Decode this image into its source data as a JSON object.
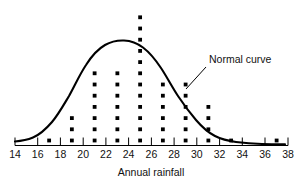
{
  "chart_data": {
    "type": "scatter",
    "title": "",
    "subtitle": "",
    "xlabel": "Annual rainfall",
    "ylabel": "",
    "xlim": [
      14,
      38
    ],
    "ylim": [
      0,
      13
    ],
    "grid": false,
    "legend_position": "none",
    "xticks": [
      14,
      16,
      18,
      20,
      22,
      24,
      26,
      28,
      30,
      32,
      34,
      36,
      38
    ],
    "xtick_labels": [
      "14",
      "16",
      "18",
      "20",
      "22",
      "24",
      "26",
      "28",
      "30",
      "32",
      "34",
      "36",
      "38"
    ],
    "plot_style": "dot-plot with fitted normal curve overlay",
    "dot_plot": {
      "description": "Stacked dots, one dot per observation, placed at odd-valued rainfall bins",
      "categories": [
        17,
        19,
        21,
        23,
        25,
        27,
        29,
        31,
        33,
        37
      ],
      "counts": [
        1,
        3,
        7,
        7,
        12,
        6,
        6,
        4,
        1,
        1
      ]
    },
    "series": [
      {
        "name": "Observations",
        "type": "scatter",
        "points": [
          {
            "x": 17,
            "count": 1
          },
          {
            "x": 19,
            "count": 3
          },
          {
            "x": 21,
            "count": 7
          },
          {
            "x": 23,
            "count": 7
          },
          {
            "x": 25,
            "count": 12
          },
          {
            "x": 27,
            "count": 6
          },
          {
            "x": 29,
            "count": 6
          },
          {
            "x": 31,
            "count": 4
          },
          {
            "x": 33,
            "count": 1
          },
          {
            "x": 37,
            "count": 1
          }
        ]
      },
      {
        "name": "Normal curve",
        "type": "line",
        "mean": 25.2,
        "std_dev": 4.1,
        "peak_height": 11.3
      }
    ],
    "annotations": [
      {
        "text": "Normal curve",
        "x": 30.5,
        "y": 8.6,
        "pointer_to_x": 28.4,
        "pointer_to_y": 6.2
      }
    ]
  },
  "axis": {
    "title": "Annual rainfall",
    "tick_labels": [
      "14",
      "16",
      "18",
      "20",
      "22",
      "24",
      "26",
      "28",
      "30",
      "32",
      "34",
      "36",
      "38"
    ]
  },
  "annotation": {
    "normal_curve_label": "Normal curve"
  },
  "colors": {
    "ink": "#000000",
    "background": "#ffffff"
  }
}
